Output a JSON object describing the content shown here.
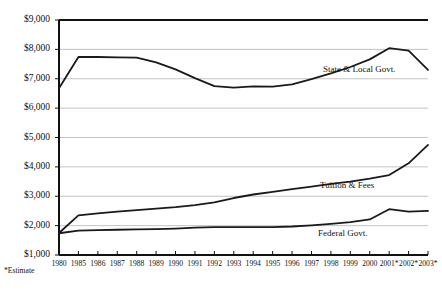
{
  "chart_data": {
    "type": "line",
    "title": "",
    "xlabel": "",
    "ylabel": "",
    "grid": true,
    "legend_position": "inline-annotations",
    "footnote": "*Estimate",
    "ylim": [
      1000,
      9000
    ],
    "ytick_labels": [
      "$9,000",
      "$8,000",
      "$7,000",
      "$6,000",
      "$5,000",
      "$4,000",
      "$3,000",
      "$2,000",
      "$1,000"
    ],
    "ytick_values": [
      9000,
      8000,
      7000,
      6000,
      5000,
      4000,
      3000,
      2000,
      1000
    ],
    "categories": [
      "1980",
      "1985",
      "1986",
      "1987",
      "1988",
      "1989",
      "1990",
      "1991",
      "1992",
      "1993",
      "1994",
      "1995",
      "1996",
      "1997",
      "1998",
      "1999",
      "2000",
      "2001*",
      "2002*",
      "2003*"
    ],
    "series": [
      {
        "name": "State & Local Govt.",
        "label": "State & Local Govt.",
        "values": [
          6680,
          7740,
          7740,
          7730,
          7720,
          7560,
          7320,
          7020,
          6750,
          6700,
          6740,
          6730,
          6810,
          6990,
          7180,
          7400,
          7660,
          8040,
          7960,
          7300
        ]
      },
      {
        "name": "Tuition & Fees",
        "label": "Tuition & Fees",
        "values": [
          1750,
          2350,
          2420,
          2480,
          2530,
          2580,
          2630,
          2700,
          2790,
          2940,
          3060,
          3150,
          3240,
          3330,
          3420,
          3500,
          3600,
          3720,
          4120,
          4750
        ]
      },
      {
        "name": "Federal Govt.",
        "label": "Federal Govt.",
        "values": [
          1740,
          1830,
          1850,
          1860,
          1870,
          1880,
          1900,
          1930,
          1950,
          1950,
          1950,
          1950,
          1970,
          2010,
          2060,
          2120,
          2210,
          2560,
          2480,
          2500
        ]
      }
    ],
    "colors": {
      "line": "#1a1a1a",
      "grid": "#b4b4b4",
      "axis": "#111111",
      "background": "#ffffff"
    }
  }
}
